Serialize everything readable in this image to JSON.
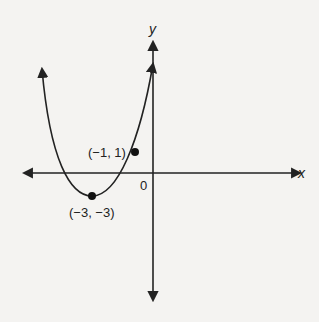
{
  "figure": {
    "type": "parabola graph",
    "axes": {
      "x_label": "x",
      "y_label": "y",
      "origin_label": "0"
    },
    "points": [
      {
        "label": "(−1, 1)",
        "x": -1,
        "y": 1
      },
      {
        "label": "(−3, −3)",
        "x": -3,
        "y": -3,
        "role": "vertex"
      }
    ],
    "curve": {
      "shape": "upward-opening parabola",
      "vertex": [
        -3,
        -3
      ],
      "passes_through": [
        -1,
        1
      ],
      "arrows_on_ends": true
    }
  },
  "colors": {
    "ink": "#222222",
    "background": "#f4f3f1"
  }
}
